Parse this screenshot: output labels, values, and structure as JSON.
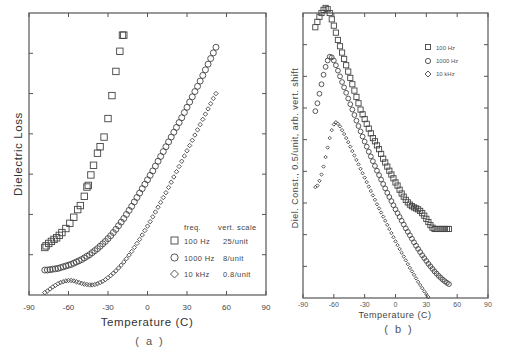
{
  "chart_data": [
    {
      "id": "a",
      "type": "scatter",
      "panel_label": "( a )",
      "title": "",
      "xlabel": "Temperature (C)",
      "ylabel": "Dielectric Loss",
      "xlim": [
        -90,
        90
      ],
      "xticks": [
        -90,
        -60,
        -30,
        0,
        30,
        60,
        90
      ],
      "ylim": [
        0,
        7
      ],
      "yticks_unlabeled": [
        1,
        2,
        3,
        4,
        5,
        6
      ],
      "grid": false,
      "legend": {
        "position": "lower right",
        "header": [
          "freq.",
          "vert. scale"
        ],
        "entries": [
          {
            "marker": "square",
            "freq": "100 Hz",
            "scale": "25/unit"
          },
          {
            "marker": "circle",
            "freq": "1000 Hz",
            "scale": "8/unit"
          },
          {
            "marker": "diamond",
            "freq": "10 kHz",
            "scale": "0.8/unit"
          }
        ]
      },
      "series": [
        {
          "name": "100 Hz",
          "marker": "square",
          "x": [
            -78,
            -77,
            -75,
            -73,
            -71,
            -69,
            -67,
            -65,
            -62,
            -59,
            -56,
            -53,
            -51,
            -48,
            -46,
            -45,
            -43,
            -41,
            -38,
            -36,
            -33,
            -30,
            -27,
            -24,
            -21,
            -19,
            -18
          ],
          "y": [
            1.18,
            1.22,
            1.28,
            1.33,
            1.38,
            1.42,
            1.48,
            1.55,
            1.65,
            1.78,
            1.93,
            2.12,
            2.22,
            2.45,
            2.68,
            2.72,
            2.98,
            3.22,
            3.52,
            3.68,
            3.92,
            4.38,
            4.95,
            5.55,
            6.05,
            6.45,
            6.45
          ]
        },
        {
          "name": "1000 Hz",
          "marker": "circle",
          "x": [
            -78,
            -76,
            -74,
            -72,
            -70,
            -68,
            -66,
            -64,
            -62,
            -60,
            -58,
            -56,
            -54,
            -52,
            -50,
            -48,
            -46,
            -44,
            -42,
            -40,
            -38,
            -36,
            -34,
            -32,
            -30,
            -28,
            -26,
            -24,
            -22,
            -20,
            -18,
            -16,
            -14,
            -12,
            -10,
            -8,
            -6,
            -4,
            -2,
            0,
            2,
            4,
            6,
            8,
            10,
            12,
            14,
            16,
            18,
            20,
            22,
            24,
            26,
            28,
            30,
            32,
            34,
            36,
            38,
            40,
            42,
            44,
            46,
            48,
            50,
            52
          ],
          "y": [
            0.62,
            0.62,
            0.63,
            0.64,
            0.65,
            0.66,
            0.68,
            0.7,
            0.72,
            0.74,
            0.76,
            0.79,
            0.82,
            0.85,
            0.88,
            0.92,
            0.96,
            1.0,
            1.05,
            1.1,
            1.15,
            1.21,
            1.27,
            1.33,
            1.4,
            1.47,
            1.55,
            1.63,
            1.72,
            1.81,
            1.9,
            2.0,
            2.1,
            2.2,
            2.31,
            2.42,
            2.53,
            2.64,
            2.75,
            2.86,
            2.97,
            3.08,
            3.2,
            3.32,
            3.44,
            3.56,
            3.68,
            3.8,
            3.92,
            4.04,
            4.16,
            4.28,
            4.4,
            4.53,
            4.66,
            4.79,
            4.92,
            5.05,
            5.18,
            5.31,
            5.45,
            5.59,
            5.73,
            5.87,
            6.01,
            6.15
          ]
        },
        {
          "name": "10 kHz",
          "marker": "diamond",
          "x": [
            -78,
            -76,
            -74,
            -72,
            -70,
            -68,
            -66,
            -64,
            -62,
            -60,
            -58,
            -56,
            -54,
            -52,
            -50,
            -48,
            -46,
            -44,
            -42,
            -40,
            -38,
            -36,
            -34,
            -32,
            -30,
            -28,
            -26,
            -24,
            -22,
            -20,
            -18,
            -16,
            -14,
            -12,
            -10,
            -8,
            -6,
            -4,
            -2,
            0,
            2,
            4,
            6,
            8,
            10,
            12,
            14,
            16,
            18,
            20,
            22,
            24,
            26,
            28,
            30,
            32,
            34,
            36,
            38,
            40,
            42,
            44,
            46,
            48,
            50,
            52
          ],
          "y": [
            0.06,
            0.1,
            0.15,
            0.2,
            0.24,
            0.28,
            0.31,
            0.33,
            0.35,
            0.36,
            0.36,
            0.35,
            0.33,
            0.31,
            0.29,
            0.27,
            0.26,
            0.25,
            0.25,
            0.26,
            0.28,
            0.31,
            0.34,
            0.38,
            0.43,
            0.48,
            0.54,
            0.6,
            0.67,
            0.74,
            0.82,
            0.9,
            0.99,
            1.08,
            1.18,
            1.28,
            1.38,
            1.49,
            1.6,
            1.71,
            1.82,
            1.94,
            2.06,
            2.18,
            2.3,
            2.42,
            2.54,
            2.67,
            2.8,
            2.93,
            3.06,
            3.19,
            3.32,
            3.45,
            3.58,
            3.71,
            3.84,
            3.97,
            4.1,
            4.23,
            4.36,
            4.49,
            4.62,
            4.75,
            4.88,
            5.0
          ]
        }
      ]
    },
    {
      "id": "b",
      "type": "scatter",
      "panel_label": "( b )",
      "title": "",
      "xlabel": "Temperature (C)",
      "ylabel": "Diel. Const., 0.5/unit, arb. vert. shift",
      "xlim": [
        -90,
        90
      ],
      "xticks": [
        -90,
        -60,
        -30,
        0,
        30,
        60,
        90
      ],
      "ylim": [
        0,
        9
      ],
      "yticks_unlabeled": [
        1,
        2,
        3,
        4,
        5,
        6,
        7,
        8
      ],
      "grid": false,
      "legend": {
        "position": "upper right",
        "entries": [
          {
            "marker": "square",
            "label": "100 Hz"
          },
          {
            "marker": "circle",
            "label": "1000 Hz"
          },
          {
            "marker": "diamond",
            "label": "10 kHz"
          }
        ]
      },
      "series": [
        {
          "name": "100 Hz",
          "marker": "square",
          "x": [
            -78,
            -76,
            -74,
            -72,
            -70,
            -68,
            -66,
            -64,
            -62,
            -60,
            -58,
            -56,
            -54,
            -52,
            -50,
            -48,
            -46,
            -44,
            -42,
            -40,
            -38,
            -36,
            -34,
            -32,
            -30,
            -28,
            -26,
            -24,
            -22,
            -20,
            -18,
            -16,
            -14,
            -12,
            -10,
            -8,
            -6,
            -4,
            -2,
            0,
            2,
            4,
            6,
            8,
            10,
            12,
            14,
            16,
            18,
            20,
            22,
            24,
            26,
            28,
            30,
            32,
            34,
            36,
            38,
            40,
            42,
            44,
            46,
            48,
            50,
            52
          ],
          "y": [
            8.55,
            8.72,
            8.88,
            9.0,
            9.1,
            9.16,
            9.12,
            9.0,
            8.8,
            8.6,
            8.38,
            8.15,
            7.95,
            7.75,
            7.55,
            7.35,
            7.15,
            6.95,
            6.75,
            6.55,
            6.35,
            6.15,
            5.95,
            5.8,
            5.65,
            5.5,
            5.35,
            5.2,
            5.05,
            4.95,
            4.82,
            4.7,
            4.55,
            4.4,
            4.28,
            4.15,
            4.02,
            3.9,
            3.78,
            3.65,
            3.55,
            3.42,
            3.3,
            3.2,
            3.1,
            3.02,
            2.95,
            2.9,
            2.86,
            2.83,
            2.8,
            2.75,
            2.68,
            2.6,
            2.5,
            2.4,
            2.3,
            2.22,
            2.18,
            2.18,
            2.18,
            2.18,
            2.18,
            2.18,
            2.18,
            2.18
          ]
        },
        {
          "name": "1000 Hz",
          "marker": "circle",
          "x": [
            -78,
            -76,
            -74,
            -72,
            -70,
            -68,
            -66,
            -64,
            -62,
            -60,
            -58,
            -56,
            -54,
            -52,
            -50,
            -48,
            -46,
            -44,
            -42,
            -40,
            -38,
            -36,
            -34,
            -32,
            -30,
            -28,
            -26,
            -24,
            -22,
            -20,
            -18,
            -16,
            -14,
            -12,
            -10,
            -8,
            -6,
            -4,
            -2,
            0,
            2,
            4,
            6,
            8,
            10,
            12,
            14,
            16,
            18,
            20,
            22,
            24,
            26,
            28,
            30,
            32,
            34,
            36,
            38,
            40,
            42,
            44,
            46,
            48,
            50,
            52
          ],
          "y": [
            5.9,
            6.15,
            6.45,
            6.75,
            7.05,
            7.3,
            7.5,
            7.62,
            7.6,
            7.5,
            7.35,
            7.18,
            7.0,
            6.82,
            6.65,
            6.48,
            6.3,
            6.12,
            5.95,
            5.78,
            5.6,
            5.43,
            5.26,
            5.1,
            4.94,
            4.78,
            4.62,
            4.47,
            4.32,
            4.17,
            4.02,
            3.88,
            3.74,
            3.6,
            3.46,
            3.32,
            3.19,
            3.06,
            2.93,
            2.8,
            2.68,
            2.56,
            2.44,
            2.32,
            2.2,
            2.09,
            1.98,
            1.87,
            1.76,
            1.65,
            1.55,
            1.45,
            1.35,
            1.26,
            1.17,
            1.08,
            1.0,
            0.92,
            0.84,
            0.77,
            0.7,
            0.64,
            0.58,
            0.53,
            0.48,
            0.44
          ]
        },
        {
          "name": "10 kHz",
          "marker": "diamond",
          "x": [
            -78,
            -76,
            -74,
            -72,
            -70,
            -68,
            -66,
            -64,
            -62,
            -60,
            -58,
            -56,
            -54,
            -52,
            -50,
            -48,
            -46,
            -44,
            -42,
            -40,
            -38,
            -36,
            -34,
            -32,
            -30,
            -28,
            -26,
            -24,
            -22,
            -20,
            -18,
            -16,
            -14,
            -12,
            -10,
            -8,
            -6,
            -4,
            -2,
            0,
            2,
            4,
            6,
            8,
            10,
            12,
            14,
            16,
            18,
            20,
            22,
            24,
            26,
            28,
            30,
            32,
            34,
            36,
            38,
            40,
            42,
            44,
            46,
            48,
            50,
            52
          ],
          "y": [
            3.5,
            3.55,
            3.7,
            3.9,
            4.15,
            4.45,
            4.75,
            5.05,
            5.3,
            5.48,
            5.55,
            5.5,
            5.42,
            5.3,
            5.18,
            5.05,
            4.92,
            4.78,
            4.64,
            4.5,
            4.36,
            4.22,
            4.08,
            3.94,
            3.8,
            3.66,
            3.52,
            3.38,
            3.24,
            3.1,
            2.96,
            2.83,
            2.7,
            2.57,
            2.44,
            2.31,
            2.18,
            2.05,
            1.92,
            1.79,
            1.67,
            1.55,
            1.43,
            1.31,
            1.19,
            1.07,
            0.95,
            0.84,
            0.73,
            0.62,
            0.51,
            0.41,
            0.31,
            0.21,
            0.12,
            0.03,
            -0.06,
            -0.14,
            -0.22,
            -0.3,
            -0.38,
            -0.45,
            -0.52,
            -0.59,
            -0.66,
            -0.72
          ]
        }
      ]
    }
  ],
  "figure": {
    "panels": [
      {
        "id": "a",
        "xlabel": "Temperature (C)",
        "ylabel": "Dielectric Loss",
        "panel_label": "( a )",
        "xtick_labels": [
          "-90",
          "-60",
          "-30",
          "0",
          "30",
          "60",
          "90"
        ],
        "legend_header_freq": "freq.",
        "legend_header_scale": "vert. scale",
        "legend": [
          {
            "freq": "100 Hz",
            "scale": "25/unit"
          },
          {
            "freq": "1000 Hz",
            "scale": "8/unit"
          },
          {
            "freq": "10 kHz",
            "scale": "0.8/unit"
          }
        ]
      },
      {
        "id": "b",
        "xlabel": "Temperature (C)",
        "ylabel": "Diel. Const.,  0.5/unit,  arb. vert. shift",
        "panel_label": "( b )",
        "xtick_labels": [
          "-90",
          "-60",
          "-30",
          "0",
          "30",
          "60",
          "90"
        ],
        "legend": [
          {
            "label": "100 Hz"
          },
          {
            "label": "1000 Hz"
          },
          {
            "label": "10 kHz"
          }
        ]
      }
    ],
    "colors": {
      "ink": "#444444",
      "frame": "#555555",
      "background": "#ffffff"
    }
  }
}
